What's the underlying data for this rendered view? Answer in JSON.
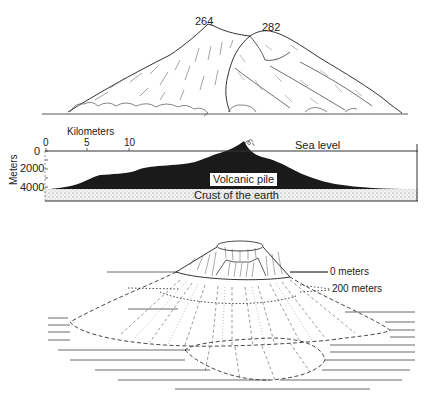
{
  "top_panel": {
    "peaks": [
      {
        "label": "264"
      },
      {
        "label": "282"
      }
    ]
  },
  "cross_section": {
    "x_axis_title": "Kilometers",
    "x_ticks": [
      "0",
      "5",
      "10"
    ],
    "y_axis_title": "Meters",
    "y_ticks": [
      "0",
      "2000",
      "4000"
    ],
    "sea_level_label": "Sea level",
    "volcanic_pile_label": "Volcanic pile",
    "crust_label": "Crust of the earth",
    "colors": {
      "pile": "#1a1a1a",
      "crust": "#e6e6e6"
    }
  },
  "bottom_panel": {
    "levels": [
      {
        "label": "0 meters"
      },
      {
        "label": "200 meters"
      }
    ]
  }
}
